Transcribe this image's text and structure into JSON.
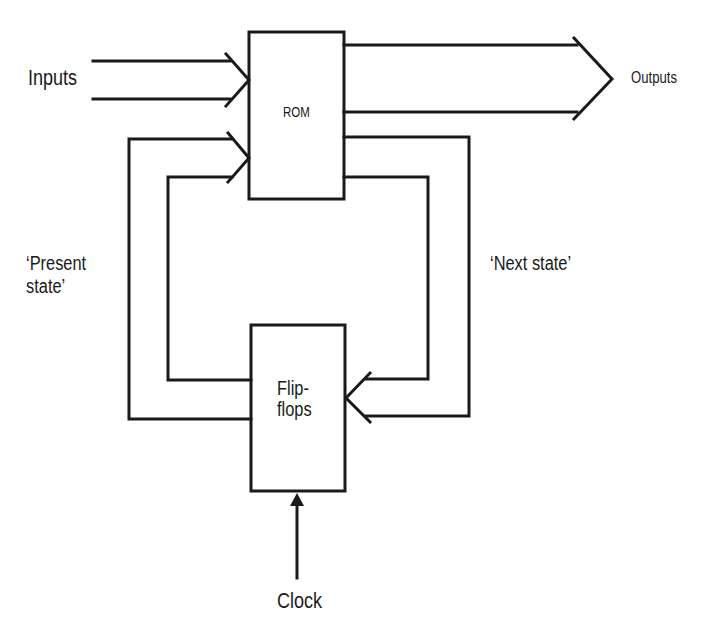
{
  "diagram": {
    "type": "block-diagram",
    "stroke_color": "#1a1a1a",
    "background": "#ffffff",
    "blocks": {
      "rom": {
        "label": "ROM"
      },
      "flipflops": {
        "line1": "Flip-",
        "line2": "flops"
      }
    },
    "labels": {
      "inputs": "Inputs",
      "outputs": "Outputs",
      "present_state_line1": "‘Present",
      "present_state_line2": "state’",
      "next_state": "‘Next state’",
      "clock": "Clock"
    },
    "connections": [
      {
        "from": "Inputs",
        "to": "ROM",
        "kind": "bus-arrow"
      },
      {
        "from": "ROM",
        "to": "Outputs",
        "kind": "bus-arrow"
      },
      {
        "from": "ROM",
        "to": "Flip-flops",
        "label": "‘Next state’",
        "kind": "bus-arrow"
      },
      {
        "from": "Flip-flops",
        "to": "ROM",
        "label": "‘Present state’",
        "kind": "bus-arrow"
      },
      {
        "from": "Clock",
        "to": "Flip-flops",
        "kind": "arrow"
      }
    ]
  }
}
